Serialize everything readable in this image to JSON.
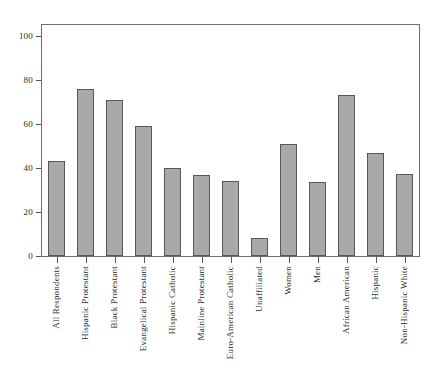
{
  "chart_data": {
    "type": "bar",
    "title": "",
    "subtitle": "",
    "xlabel": "",
    "ylabel": "",
    "ylim": [
      0,
      105
    ],
    "yticks": [
      0,
      20,
      40,
      60,
      80,
      100
    ],
    "grid": false,
    "legend": false,
    "bar_color": "#a9a9a9",
    "bar_edge_color": "#585858",
    "frame_color": "#6d6d6d",
    "categories": [
      "All Respondents",
      "Hispanic Protestant",
      "Black Protestant",
      "Evangelical Protestant",
      "Hispanic Catholic",
      "Mainline Protestant",
      "Euro-American Catholic",
      "Unaffiliated",
      "Women",
      "Men",
      "African American",
      "Hispanic",
      "Non-Hispanic White"
    ],
    "values": [
      43,
      76,
      71,
      59,
      40,
      37,
      34,
      8,
      51,
      33.5,
      73,
      47,
      37.5
    ]
  }
}
